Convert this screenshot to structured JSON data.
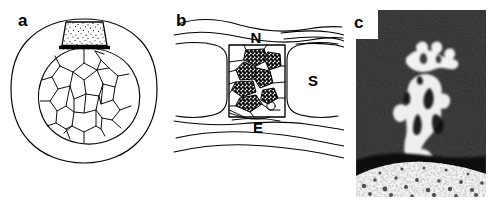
{
  "figure": {
    "background_color": "#ffffff",
    "ink_color": "#000000",
    "width": 496,
    "height": 204,
    "panel_count": 3
  },
  "panels": [
    {
      "id": "a",
      "label": "a",
      "kind": "line-drawing",
      "description": "Cross-section schematic: outer rounded boundary enclosing a circular mosaic of polygonal cells, capped by a stippled trapezoidal block separated by a thick dark bar",
      "annotations": []
    },
    {
      "id": "b",
      "label": "b",
      "kind": "line-drawing",
      "description": "Longitudinal schematic: wavy tissue layers above and below a central box containing stippled polygonal cells, flanked by two large clear rounded cells",
      "annotations": [
        {
          "text": "N",
          "position": "top-center"
        },
        {
          "text": "S",
          "position": "right-middle"
        },
        {
          "text": "E",
          "position": "bottom-center"
        }
      ]
    },
    {
      "id": "c",
      "label": "c",
      "kind": "micrograph",
      "description": "Black-and-white photomicrograph: bright irregular vertical structure on a dark background above a light granular textured band",
      "annotations": []
    }
  ],
  "labels": {
    "a": "a",
    "b": "b",
    "c": "c",
    "N": "N",
    "S": "S",
    "E": "E"
  }
}
